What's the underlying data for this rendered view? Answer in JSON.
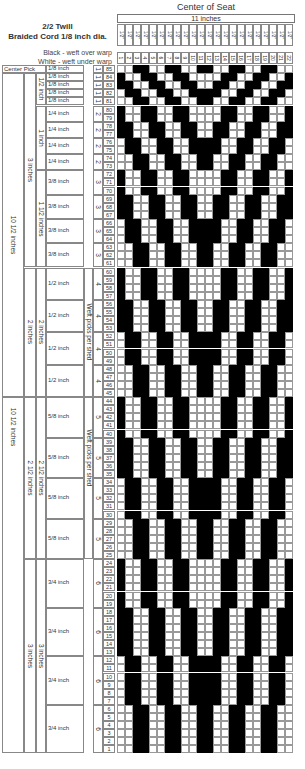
{
  "header": {
    "title_line1": "2/2 Twill",
    "title_line2": "Braided Cord 1/8 inch dia.",
    "legend_black": "Black - weft over warp",
    "legend_white": "White - weft under warp",
    "center_title": "Center of Seat",
    "width_label": "11 inches"
  },
  "columns": {
    "count": 22,
    "width_label": "1/2\"",
    "numbers": [
      "1",
      "2",
      "3",
      "4",
      "5",
      "6",
      "7",
      "8",
      "9",
      "10",
      "11",
      "12",
      "13",
      "14",
      "15",
      "16",
      "17",
      "18",
      "19",
      "20",
      "21",
      "22"
    ]
  },
  "pattern": {
    "black_color": "#000000",
    "white_color": "#ffffff",
    "rule": "2/2 twill, mirrored about center; phase shifts by one per shed"
  },
  "center_pick": {
    "label": "Center Pick",
    "size": "1/8 inch",
    "picks": "1",
    "pick_number": "85"
  },
  "sheds": [
    {
      "size": "1/8 inch",
      "picks": "1",
      "from": 84,
      "to": 84
    },
    {
      "size": "1/8 inch",
      "picks": "1",
      "from": 83,
      "to": 83
    },
    {
      "size": "1/8 inch",
      "picks": "1",
      "from": 82,
      "to": 82
    },
    {
      "size": "1/8 inch",
      "picks": "1",
      "from": 81,
      "to": 81
    },
    {
      "size": "1/4 inch",
      "picks": "2",
      "from": 80,
      "to": 79
    },
    {
      "size": "1/4 inch",
      "picks": "2",
      "from": 78,
      "to": 77
    },
    {
      "size": "1/4 inch",
      "picks": "2",
      "from": 76,
      "to": 75
    },
    {
      "size": "1/4 inch",
      "picks": "2",
      "from": 74,
      "to": 73
    },
    {
      "size": "3/8 inch",
      "picks": "3",
      "from": 72,
      "to": 70
    },
    {
      "size": "3/8 inch",
      "picks": "3",
      "from": 69,
      "to": 67
    },
    {
      "size": "3/8 inch",
      "picks": "3",
      "from": 66,
      "to": 64
    },
    {
      "size": "3/8 inch",
      "picks": "3",
      "from": 63,
      "to": 61
    },
    {
      "size": "1/2 inch",
      "picks": "4",
      "from": 60,
      "to": 57
    },
    {
      "size": "1/2 inch",
      "picks": "4",
      "from": 56,
      "to": 53
    },
    {
      "size": "1/2 inch",
      "picks": "4",
      "from": 52,
      "to": 49
    },
    {
      "size": "1/2 inch",
      "picks": "4",
      "from": 48,
      "to": 45
    },
    {
      "size": "5/8 inch",
      "picks": "5",
      "from": 44,
      "to": 40
    },
    {
      "size": "5/8 inch",
      "picks": "5",
      "from": 39,
      "to": 35
    },
    {
      "size": "5/8 inch",
      "picks": "5",
      "from": 34,
      "to": 30
    },
    {
      "size": "5/8 inch",
      "picks": "5",
      "from": 29,
      "to": 25
    },
    {
      "size": "3/4 inch",
      "picks": "6",
      "from": 24,
      "to": 19
    },
    {
      "size": "3/4 inch",
      "picks": "6",
      "from": 18,
      "to": 13
    },
    {
      "size": "3/4 inch",
      "picks": "6",
      "from": 12,
      "to": 7
    },
    {
      "size": "3/4 inch",
      "picks": "6",
      "from": 6,
      "to": 1
    }
  ],
  "groups": [
    {
      "label": "1/2 inch",
      "from": 84,
      "to": 81
    },
    {
      "label": "1 inch",
      "from": 80,
      "to": 73
    },
    {
      "label": "1 1/2 inches",
      "from": 72,
      "to": 61
    },
    {
      "label": "2 inches",
      "from": 60,
      "to": 45
    },
    {
      "label": "2 1/2 inches",
      "from": 44,
      "to": 25
    },
    {
      "label": "3 inches",
      "from": 24,
      "to": 1
    }
  ],
  "outer_groups": [
    {
      "label": "3 inches",
      "from": 84,
      "to": 61
    },
    {
      "label": "2 inches",
      "from": 60,
      "to": 45
    },
    {
      "label": "2 1/2 inches",
      "from": 44,
      "to": 25
    },
    {
      "label": "3 inches",
      "from": 24,
      "to": 1
    }
  ],
  "half_totals": [
    {
      "label": "10 1/2 inches",
      "from": 85,
      "to": 45
    },
    {
      "label": "10 1/2 inches",
      "from": 44,
      "to": 1
    }
  ],
  "weft_label": [
    {
      "label": "Weft picks per shed",
      "from": 60,
      "to": 45
    },
    {
      "label": "Weft picks per shed",
      "from": 44,
      "to": 30
    }
  ]
}
